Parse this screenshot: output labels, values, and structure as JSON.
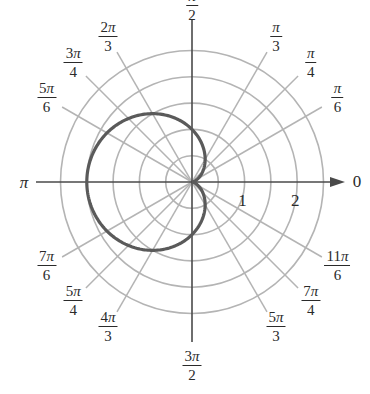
{
  "chart_data": {
    "type": "polar",
    "title": "",
    "equation": "r = 1 - cos(θ)",
    "curve": {
      "name": "cardioid",
      "formula": "1 - cos(theta)",
      "color": "#5a5a5a",
      "width": 3.2
    },
    "grid": {
      "circles_radii": [
        0.5,
        1,
        1.5,
        2,
        2.5
      ],
      "circle_color": "#b4b4b4",
      "ray_color": "#b4b4b4",
      "rays_degrees": [
        30,
        45,
        60,
        120,
        135,
        150,
        210,
        225,
        240,
        300,
        315,
        330
      ]
    },
    "axes": {
      "color": "#4a4a4a",
      "radial_tick_labels": [
        {
          "value": 1,
          "text": "1"
        },
        {
          "value": 2,
          "text": "2"
        }
      ]
    },
    "angle_labels": [
      {
        "deg": 0,
        "num": "",
        "den": "",
        "plain": "0"
      },
      {
        "deg": 30,
        "num": "π",
        "den": "6"
      },
      {
        "deg": 45,
        "num": "π",
        "den": "4"
      },
      {
        "deg": 60,
        "num": "π",
        "den": "3"
      },
      {
        "deg": 90,
        "num": "π",
        "den": "2"
      },
      {
        "deg": 120,
        "num": "2π",
        "den": "3"
      },
      {
        "deg": 135,
        "num": "3π",
        "den": "4"
      },
      {
        "deg": 150,
        "num": "5π",
        "den": "6"
      },
      {
        "deg": 180,
        "num": "",
        "den": "",
        "plain": "π"
      },
      {
        "deg": 210,
        "num": "7π",
        "den": "6"
      },
      {
        "deg": 225,
        "num": "5π",
        "den": "4"
      },
      {
        "deg": 240,
        "num": "4π",
        "den": "3"
      },
      {
        "deg": 270,
        "num": "3π",
        "den": "2"
      },
      {
        "deg": 300,
        "num": "5π",
        "den": "3"
      },
      {
        "deg": 315,
        "num": "7π",
        "den": "4"
      },
      {
        "deg": 330,
        "num": "11π",
        "den": "6"
      }
    ],
    "rlim": [
      0,
      2.5
    ]
  },
  "layout": {
    "center": [
      192,
      182
    ],
    "unit_px": 52.6,
    "ray_length_px": 150,
    "label_radius_px": 168
  }
}
